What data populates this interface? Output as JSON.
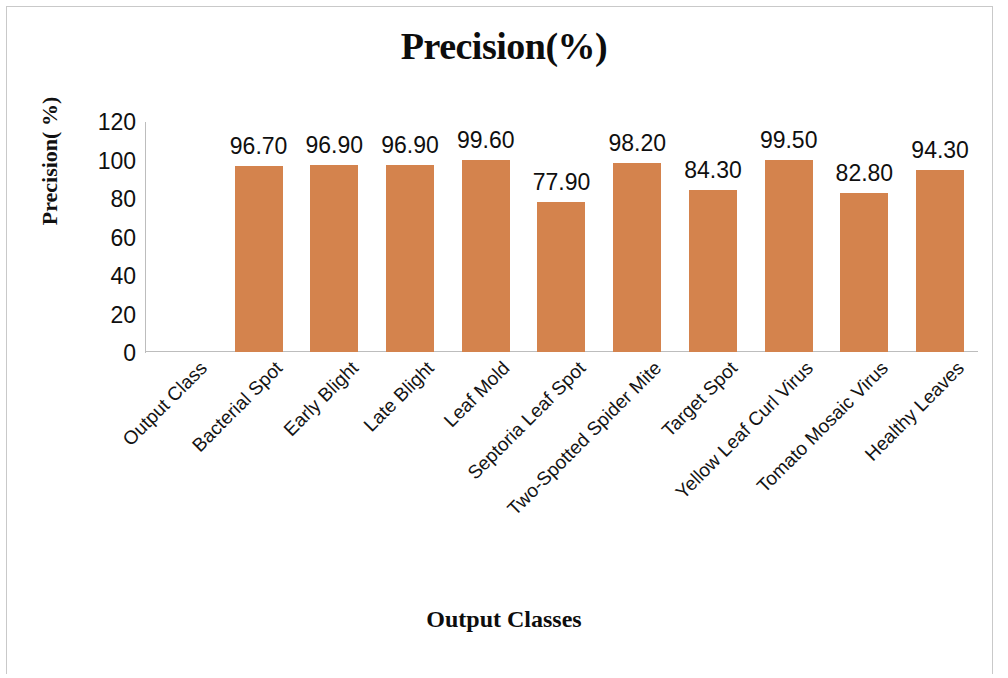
{
  "chart_data": {
    "type": "bar",
    "title": "Precision(%)",
    "xlabel": "Output Classes",
    "ylabel": "Precision( %)",
    "ylim": [
      0,
      120
    ],
    "yticks": [
      120,
      100,
      80,
      60,
      40,
      20,
      0
    ],
    "ytick_labels": [
      "120",
      "100",
      "80",
      "60",
      "40",
      "20",
      "0"
    ],
    "grid": false,
    "legend": "none",
    "bar_color": "#d4834d",
    "axis_color": "#bdbdbd",
    "categories": [
      "Output Class",
      "Bacterial Spot",
      "Early Blight",
      "Late Blight",
      "Leaf Mold",
      "Septoria Leaf Spot",
      "Two-Spotted Spider Mite",
      "Target Spot",
      "Yellow Leaf Curl Virus",
      "Tomato Mosaic Virus",
      "Healthy Leaves"
    ],
    "values": [
      null,
      96.7,
      96.9,
      96.9,
      99.6,
      77.9,
      98.2,
      84.3,
      99.5,
      82.8,
      94.3
    ],
    "data_labels": [
      "",
      "96.70",
      "96.90",
      "96.90",
      "99.60",
      "77.90",
      "98.20",
      "84.30",
      "99.50",
      "82.80",
      "94.30"
    ]
  }
}
